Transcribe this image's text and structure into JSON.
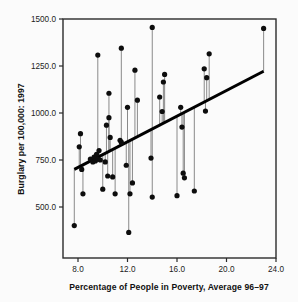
{
  "chart_data": {
    "type": "scatter",
    "title": "",
    "xlabel": "Percentage of People in Poverty, Average 96–97",
    "ylabel": "Burglary per 100,000: 1997",
    "xlim": [
      7.0,
      24.0
    ],
    "ylim": [
      370,
      1500
    ],
    "grid": false,
    "legend": null,
    "xticks": [
      "8.0",
      "12.0",
      "16.0",
      "20.0",
      "24.0"
    ],
    "xtick_values": [
      8.0,
      12.0,
      16.0,
      20.0,
      24.0
    ],
    "yticks": [
      "500.0",
      "750.0",
      "1000.0",
      "1250.0",
      "1500.0"
    ],
    "ytick_values": [
      500,
      750,
      1000,
      1250,
      1500
    ],
    "marker": "filled-circle",
    "marker_color": "#0d0d0d",
    "dropline_color": "#8a8a8a",
    "fitline_color": "#000000",
    "annotation": "Vertical residual lines connect each point to the fitted regression line",
    "fit_line": {
      "type": "linear-fit",
      "x_start": 7.7,
      "y_start": 700,
      "x_end": 23.0,
      "y_end": 1222
    },
    "x": [
      7.7,
      8.1,
      8.2,
      8.3,
      8.4,
      9.0,
      9.2,
      9.3,
      9.4,
      9.5,
      9.6,
      9.7,
      9.8,
      10.0,
      10.2,
      10.3,
      10.4,
      10.5,
      10.6,
      10.8,
      11.0,
      11.2,
      11.4,
      11.5,
      11.6,
      11.9,
      12.1,
      12.2,
      12.4,
      12.6,
      12.8,
      13.0,
      13.9,
      14.0,
      14.3,
      14.6,
      14.8,
      14.9,
      15.0,
      16.0,
      16.3,
      16.5,
      16.6,
      17.4,
      18.2,
      18.3,
      18.5,
      18.6,
      23.0
    ],
    "y": [
      401,
      820,
      890,
      700,
      570,
      755,
      740,
      765,
      745,
      780,
      755,
      800,
      750,
      1308,
      595,
      935,
      740,
      665,
      975,
      870,
      1105,
      660,
      570,
      855,
      845,
      1345,
      365,
      722,
      1030,
      570,
      628,
      1228,
      1068,
      1455,
      553,
      760,
      1085,
      1008,
      1165,
      1205,
      560,
      1030,
      680,
      655,
      925,
      585,
      1235,
      1010,
      1188,
      1315,
      1450
    ],
    "points": [
      {
        "x": 7.7,
        "y": 401
      },
      {
        "x": 8.1,
        "y": 820
      },
      {
        "x": 8.2,
        "y": 890
      },
      {
        "x": 8.3,
        "y": 700
      },
      {
        "x": 8.4,
        "y": 570
      },
      {
        "x": 9.0,
        "y": 755
      },
      {
        "x": 9.2,
        "y": 740
      },
      {
        "x": 9.3,
        "y": 765
      },
      {
        "x": 9.4,
        "y": 745
      },
      {
        "x": 9.5,
        "y": 780
      },
      {
        "x": 9.6,
        "y": 755
      },
      {
        "x": 9.7,
        "y": 800
      },
      {
        "x": 9.8,
        "y": 750
      },
      {
        "x": 9.6,
        "y": 1308
      },
      {
        "x": 10.0,
        "y": 595
      },
      {
        "x": 10.3,
        "y": 935
      },
      {
        "x": 10.2,
        "y": 740
      },
      {
        "x": 10.4,
        "y": 665
      },
      {
        "x": 10.5,
        "y": 975
      },
      {
        "x": 10.6,
        "y": 870
      },
      {
        "x": 10.5,
        "y": 1105
      },
      {
        "x": 10.8,
        "y": 660
      },
      {
        "x": 11.0,
        "y": 570
      },
      {
        "x": 11.4,
        "y": 855
      },
      {
        "x": 11.5,
        "y": 845
      },
      {
        "x": 11.5,
        "y": 1345
      },
      {
        "x": 12.1,
        "y": 365
      },
      {
        "x": 11.9,
        "y": 722
      },
      {
        "x": 12.0,
        "y": 1030
      },
      {
        "x": 12.2,
        "y": 570
      },
      {
        "x": 12.4,
        "y": 628
      },
      {
        "x": 12.6,
        "y": 1228
      },
      {
        "x": 12.8,
        "y": 1068
      },
      {
        "x": 14.0,
        "y": 1455
      },
      {
        "x": 13.9,
        "y": 760
      },
      {
        "x": 14.0,
        "y": 553
      },
      {
        "x": 14.6,
        "y": 1085
      },
      {
        "x": 14.8,
        "y": 1008
      },
      {
        "x": 14.9,
        "y": 1165
      },
      {
        "x": 15.0,
        "y": 1205
      },
      {
        "x": 16.0,
        "y": 560
      },
      {
        "x": 16.3,
        "y": 1030
      },
      {
        "x": 16.5,
        "y": 680
      },
      {
        "x": 16.6,
        "y": 655
      },
      {
        "x": 16.4,
        "y": 925
      },
      {
        "x": 17.4,
        "y": 585
      },
      {
        "x": 18.2,
        "y": 1235
      },
      {
        "x": 18.3,
        "y": 1010
      },
      {
        "x": 18.4,
        "y": 1188
      },
      {
        "x": 18.6,
        "y": 1315
      },
      {
        "x": 23.0,
        "y": 1450
      }
    ]
  }
}
